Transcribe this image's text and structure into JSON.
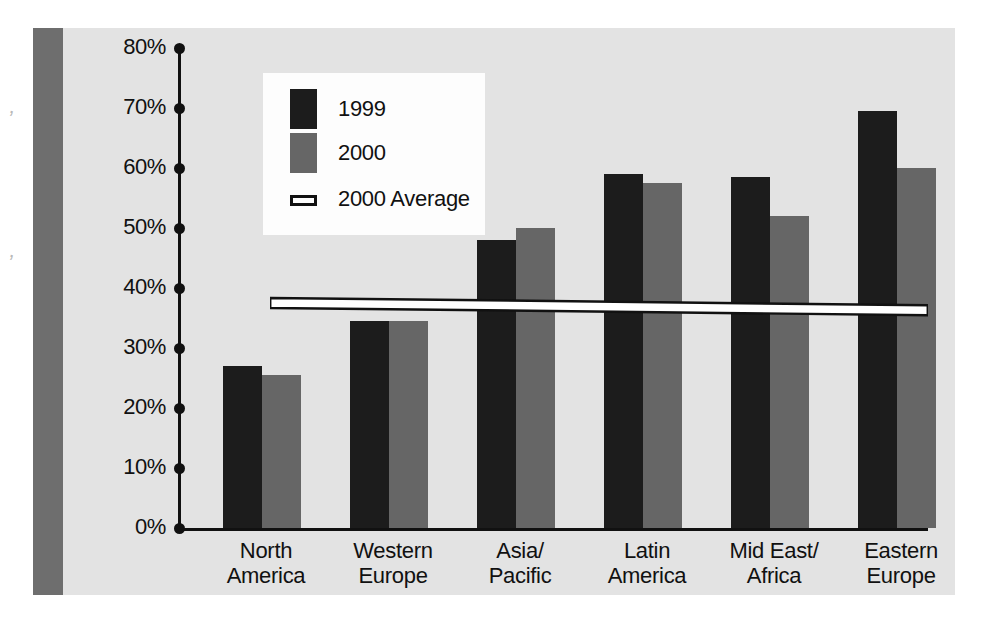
{
  "chart_data": {
    "type": "bar",
    "title": "",
    "xlabel": "",
    "ylabel": "",
    "ylim": [
      0,
      80
    ],
    "grid": false,
    "legend_position": "top-left",
    "categories": [
      "North\nAmerica",
      "Western\nEurope",
      "Asia/\nPacific",
      "Latin\nAmerica",
      "Mid East/\nAfrica",
      "Eastern\nEurope"
    ],
    "category_lines": [
      [
        "North",
        "America"
      ],
      [
        "Western",
        "Europe"
      ],
      [
        "Asia/",
        "Pacific"
      ],
      [
        "Latin",
        "America"
      ],
      [
        "Mid East/",
        "Africa"
      ],
      [
        "Eastern",
        "Europe"
      ]
    ],
    "series": [
      {
        "name": "1999",
        "color": "#1c1c1c",
        "values": [
          27,
          34.5,
          48,
          59,
          58.5,
          69.5
        ]
      },
      {
        "name": "2000",
        "color": "#666666",
        "values": [
          25.5,
          34.5,
          50,
          57.5,
          52,
          60
        ]
      }
    ],
    "reference_line": {
      "name": "2000 Average",
      "color": "#ffffff",
      "outline": "#111111",
      "start_value": 37.5,
      "end_value": 36.3
    },
    "y_ticks": [
      {
        "value": 80,
        "label": "80%"
      },
      {
        "value": 70,
        "label": "70%"
      },
      {
        "value": 60,
        "label": "60%"
      },
      {
        "value": 50,
        "label": "50%"
      },
      {
        "value": 40,
        "label": "40%"
      },
      {
        "value": 30,
        "label": "30%"
      },
      {
        "value": 20,
        "label": "20%"
      },
      {
        "value": 10,
        "label": "10%"
      },
      {
        "value": 0,
        "label": "0%"
      }
    ]
  },
  "legend": {
    "items": [
      {
        "label": "1999",
        "swatch": "dark-square-swatch"
      },
      {
        "label": "2000",
        "swatch": "gray-square-swatch"
      },
      {
        "label": "2000 Average",
        "swatch": "white-line-swatch"
      }
    ]
  },
  "colors": {
    "panel_background": "#e3e3e3",
    "left_band": "#6e6e6e",
    "axis": "#111111",
    "series_1999": "#1c1c1c",
    "series_2000": "#666666",
    "legend_background": "#fdfdfd",
    "average_line": "#ffffff"
  }
}
